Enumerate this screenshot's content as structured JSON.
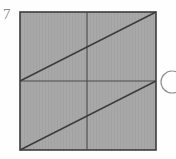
{
  "figure": {
    "label": "7",
    "label_color": "#8a8a8a",
    "background_color": "#fefefe"
  },
  "square": {
    "name": "shaded-square",
    "fill_color": "#a8a8a8",
    "stroke_color": "#3c3c3c",
    "stroke_width": 1.6,
    "x": 20,
    "y": 12,
    "width": 136,
    "height": 138
  },
  "lines": [
    {
      "name": "vertical-midline",
      "x1": 87,
      "y1": 12,
      "x2": 87,
      "y2": 150,
      "color": "#4a4a4a",
      "width": 1.1
    },
    {
      "name": "horizontal-midline",
      "x1": 20,
      "y1": 81,
      "x2": 156,
      "y2": 81,
      "color": "#4a4a4a",
      "width": 1.1
    },
    {
      "name": "upper-diagonal",
      "x1": 20,
      "y1": 81,
      "x2": 156,
      "y2": 12,
      "color": "#3c3c3c",
      "width": 1.5
    },
    {
      "name": "lower-diagonal",
      "x1": 20,
      "y1": 150,
      "x2": 156,
      "y2": 81,
      "color": "#3c3c3c",
      "width": 1.5
    }
  ],
  "circle_marker": {
    "name": "circled-marker",
    "cx": 172,
    "cy": 82,
    "r": 11,
    "stroke_color": "#8f8f8f",
    "stroke_width": 1.2,
    "fill": "none"
  }
}
